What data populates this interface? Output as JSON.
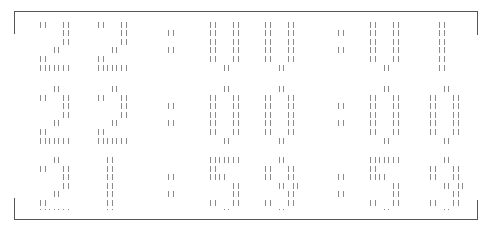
{
  "clock": {
    "rows": [
      {
        "time": "22:00:01",
        "top": 13,
        "clip_top": 20,
        "clip_bottom": 75
      },
      {
        "time": "22:00:00",
        "top": 86,
        "clip_top": 80,
        "clip_bottom": 145
      },
      {
        "time": "21:59:59",
        "top": 157,
        "clip_top": 150,
        "clip_bottom": 210
      }
    ],
    "glyph_x": [
      40,
      98,
      168,
      210,
      265,
      338,
      370,
      430
    ],
    "col_pitch": 4.6,
    "row_pitch": 8.6,
    "bar_color": "#8a8a8a",
    "frame_color": "#555555"
  },
  "font": {
    "0": [
      "   ||  ",
      "||   ||",
      "||   ||",
      "||   ||",
      "||   ||",
      "||   ||",
      "   ||  "
    ],
    "1": [
      "  ||   ",
      "  ||   ",
      "  ||   ",
      "  ||   ",
      "  ||   ",
      "  ||   ",
      "  ||   "
    ],
    "2": [
      "   ||  ",
      "||   ||",
      "     ||",
      "     ||",
      "   ||  ",
      "||     ",
      "|||||||"
    ],
    "5": [
      "|||||||",
      "||     ",
      "||||   ",
      "     ||",
      "     ||",
      "||   ||",
      "   ||  "
    ],
    "9": [
      "   ||  ",
      "||   ||",
      "||   ||",
      "   || ||",
      "     ||",
      "||   ||",
      "   ||  "
    ],
    ":": [
      "       ",
      "       ",
      "||     ",
      "       ",
      "||     ",
      "       ",
      "       "
    ]
  }
}
